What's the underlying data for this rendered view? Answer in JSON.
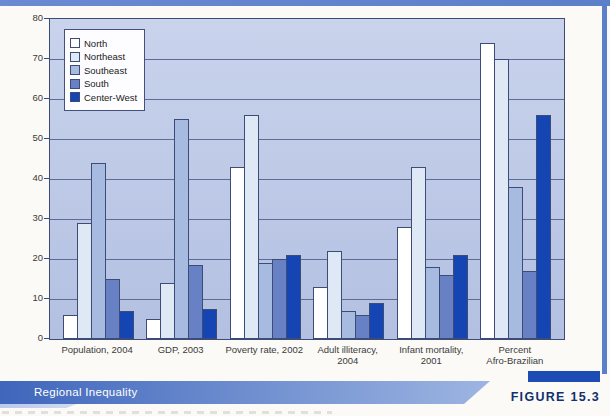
{
  "figure": {
    "title_bar": "Regional Inequality",
    "figure_label": "FIGURE 15.3"
  },
  "chart_data": {
    "type": "bar",
    "title": "",
    "xlabel": "",
    "ylabel": "",
    "ylim": [
      0,
      80
    ],
    "yticks": [
      0,
      10,
      20,
      30,
      40,
      50,
      60,
      70,
      80
    ],
    "grid": true,
    "legend_position": "upper-left",
    "categories": [
      "Population, 2004",
      "GDP, 2003",
      "Poverty rate, 2002",
      "Adult illiteracy, 2004",
      "Infant mortality, 2001",
      "Percent Afro-Brazilian"
    ],
    "category_label_lines": [
      [
        "Population, 2004"
      ],
      [
        "GDP, 2003"
      ],
      [
        "Poverty rate, 2002"
      ],
      [
        "Adult illiteracy,",
        "2004"
      ],
      [
        "Infant mortality,",
        "2001"
      ],
      [
        "Percent",
        "Afro-Brazilian"
      ]
    ],
    "series": [
      {
        "name": "North",
        "color": "#ffffff",
        "values": [
          6,
          5,
          43,
          13,
          28,
          74
        ]
      },
      {
        "name": "Northeast",
        "color": "#dfe8f5",
        "values": [
          29,
          14,
          56,
          22,
          43,
          70
        ]
      },
      {
        "name": "Southeast",
        "color": "#a7badf",
        "values": [
          44,
          55,
          19,
          7,
          18,
          38
        ]
      },
      {
        "name": "South",
        "color": "#6781c4",
        "values": [
          15,
          18.5,
          20,
          6,
          16,
          17
        ]
      },
      {
        "name": "Center-West",
        "color": "#1545b2",
        "values": [
          7,
          7.5,
          21,
          9,
          21,
          56
        ]
      }
    ]
  },
  "colors": {
    "frame_blue": "#5c7fca",
    "plot_bg_top": "#c9d3ec",
    "plot_bg_bottom": "#b3c0e1",
    "gridline": "#5c6c96",
    "bar_border": "#3d4c77",
    "title_bar_left": "#3f66bc",
    "title_bar_right": "#9db5e2",
    "title_text": "#ffffff",
    "ribbon_blue": "#1d4db4",
    "figure_label_text": "#10306e",
    "axis_text": "#3a3a3a"
  }
}
